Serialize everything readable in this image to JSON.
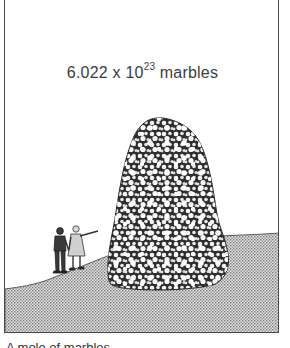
{
  "figure": {
    "label": {
      "mantissa": "6.022",
      "times": "x",
      "base": "10",
      "exponent": "23",
      "unit": "marbles"
    },
    "elements": {
      "pile": "marble-pile",
      "people": [
        "person-standing",
        "person-pointing"
      ],
      "ground": "stippled-hillside"
    },
    "colors": {
      "border": "#4a4a4a",
      "text": "#3c3c3c",
      "pile_dark": "#2e2e2e",
      "marble": "#f4f4f4",
      "ground_fill": "#b9b9b9",
      "background": "#ffffff"
    }
  },
  "caption": {
    "text": "A mole of marbles"
  }
}
